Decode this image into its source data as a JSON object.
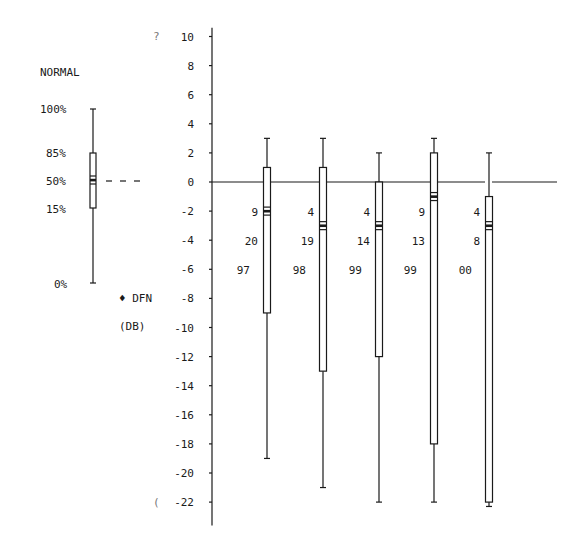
{
  "chart_data": {
    "type": "boxplot",
    "title": "",
    "ylabel": "DFN (DB)",
    "ylabel_lines": [
      "♦ DFN",
      "(DB)"
    ],
    "ylim": [
      -22,
      10
    ],
    "yticks": [
      10,
      8,
      6,
      4,
      2,
      0,
      -2,
      -4,
      -6,
      -8,
      -10,
      -12,
      -14,
      -16,
      -18,
      -20,
      -22
    ],
    "grid": false,
    "zero_line": true,
    "legend": {
      "title": "NORMAL",
      "percentile_labels": [
        "100%",
        "85%",
        "50%",
        "15%",
        "0%"
      ]
    },
    "series": [
      {
        "labels": [
          "9",
          "20",
          "97"
        ],
        "whisker_high": 3,
        "q85": 1,
        "median": -2,
        "q15": -9,
        "whisker_low": -19
      },
      {
        "labels": [
          "4",
          "19",
          "98"
        ],
        "whisker_high": 3,
        "q85": 1,
        "median": -3,
        "q15": -13,
        "whisker_low": -21
      },
      {
        "labels": [
          "4",
          "14",
          "99"
        ],
        "whisker_high": 2,
        "q85": 0,
        "median": -3,
        "q15": -12,
        "whisker_low": -22
      },
      {
        "labels": [
          "9",
          "13",
          "99"
        ],
        "whisker_high": 3,
        "q85": 2,
        "median": -1,
        "q15": -18,
        "whisker_low": -22
      },
      {
        "labels": [
          "4",
          "8",
          "00"
        ],
        "whisker_high": 2,
        "q85": -1,
        "median": -3,
        "q15": -22,
        "whisker_low": -22.3
      }
    ]
  },
  "legend_title": "NORMAL",
  "legend_labels": {
    "p100": "100%",
    "p85": "85%",
    "p50": "50%",
    "p15": "15%",
    "p0": "0%"
  },
  "axis_label": {
    "line1": "♦ DFN",
    "line2": "(DB)"
  },
  "fragments": {
    "top": "?",
    "bottom": "("
  }
}
